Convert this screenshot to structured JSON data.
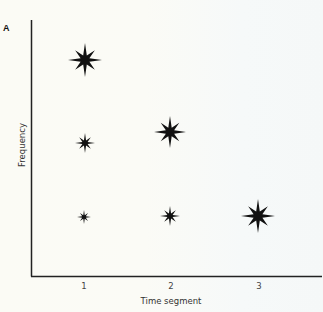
{
  "figure": {
    "panel_label": "A",
    "background_color": "#fbfbf5",
    "axis_color": "#222222",
    "marker_color": "#111111"
  },
  "chart_data": {
    "type": "scatter",
    "title": "",
    "xlabel": "Time segment",
    "ylabel": "Frequency",
    "x_ticks": [
      "1",
      "2",
      "3"
    ],
    "y_ticks": [],
    "grid": false,
    "legend": null,
    "marker": "eight-pointed star",
    "size_encoding": "star size indicates magnitude",
    "points": [
      {
        "x": 1,
        "y_level": "high",
        "size": "large"
      },
      {
        "x": 1,
        "y_level": "medium",
        "size": "small"
      },
      {
        "x": 1,
        "y_level": "low",
        "size": "smallest"
      },
      {
        "x": 2,
        "y_level": "medium",
        "size": "large"
      },
      {
        "x": 2,
        "y_level": "low",
        "size": "small"
      },
      {
        "x": 3,
        "y_level": "low",
        "size": "large"
      }
    ],
    "pixel_points": [
      {
        "cx": 85,
        "cy": 60,
        "r": 17
      },
      {
        "cx": 85,
        "cy": 143,
        "r": 10
      },
      {
        "cx": 84,
        "cy": 217,
        "r": 7
      },
      {
        "cx": 170,
        "cy": 132,
        "r": 16
      },
      {
        "cx": 170,
        "cy": 216,
        "r": 10
      },
      {
        "cx": 258,
        "cy": 216,
        "r": 17
      }
    ]
  }
}
